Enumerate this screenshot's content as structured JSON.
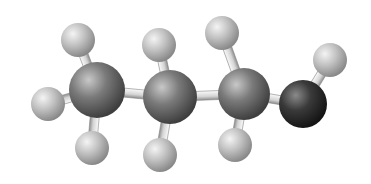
{
  "molecule": {
    "name": "1-propanol",
    "style": "ball-and-stick",
    "colors": {
      "background": "#ffffff",
      "carbon_light": "#b8b8b8",
      "carbon_dark": "#4a4a4a",
      "oxygen_light": "#8a8a8a",
      "oxygen_dark": "#1e1e1e",
      "hydrogen_light": "#e6e6e6",
      "hydrogen_dark": "#8e8e8e",
      "bond_light": "#f2f2f2",
      "bond_dark": "#9a9a9a"
    },
    "atoms": [
      {
        "id": "C1",
        "element": "C",
        "x": 97,
        "y": 90,
        "r": 28
      },
      {
        "id": "C2",
        "element": "C",
        "x": 170,
        "y": 97,
        "r": 27
      },
      {
        "id": "C3",
        "element": "C",
        "x": 244,
        "y": 94,
        "r": 26
      },
      {
        "id": "O1",
        "element": "O",
        "x": 303,
        "y": 104,
        "r": 24
      },
      {
        "id": "H1",
        "element": "H",
        "x": 78,
        "y": 40,
        "r": 17
      },
      {
        "id": "H2",
        "element": "H",
        "x": 48,
        "y": 104,
        "r": 17
      },
      {
        "id": "H3",
        "element": "H",
        "x": 92,
        "y": 148,
        "r": 17
      },
      {
        "id": "H4",
        "element": "H",
        "x": 159,
        "y": 45,
        "r": 17
      },
      {
        "id": "H5",
        "element": "H",
        "x": 160,
        "y": 155,
        "r": 17
      },
      {
        "id": "H6",
        "element": "H",
        "x": 222,
        "y": 33,
        "r": 17
      },
      {
        "id": "H7",
        "element": "H",
        "x": 235,
        "y": 145,
        "r": 17
      },
      {
        "id": "H8",
        "element": "H",
        "x": 330,
        "y": 60,
        "r": 17
      }
    ],
    "bonds": [
      [
        "C1",
        "C2"
      ],
      [
        "C2",
        "C3"
      ],
      [
        "C3",
        "O1"
      ],
      [
        "C1",
        "H1"
      ],
      [
        "C1",
        "H2"
      ],
      [
        "C1",
        "H3"
      ],
      [
        "C2",
        "H4"
      ],
      [
        "C2",
        "H5"
      ],
      [
        "C3",
        "H6"
      ],
      [
        "C3",
        "H7"
      ],
      [
        "O1",
        "H8"
      ]
    ]
  }
}
